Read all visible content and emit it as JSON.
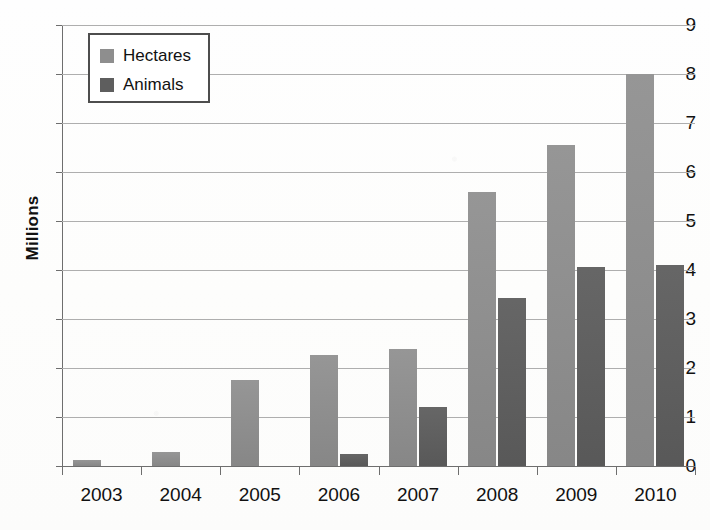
{
  "chart_data": {
    "type": "bar",
    "title": "",
    "xlabel": "",
    "ylabel": "Millions",
    "categories": [
      "2003",
      "2004",
      "2005",
      "2006",
      "2007",
      "2008",
      "2009",
      "2010"
    ],
    "series": [
      {
        "name": "Hectares",
        "color": "#8e8e8e",
        "values": [
          0.12,
          0.28,
          1.76,
          2.26,
          2.38,
          5.59,
          6.55,
          8.0
        ]
      },
      {
        "name": "Animals",
        "color": "#5e5e5e",
        "values": [
          0,
          0,
          0,
          0.25,
          1.2,
          3.43,
          4.06,
          4.1
        ]
      }
    ],
    "ylim": [
      0,
      9
    ],
    "ytick_labels": [
      "0",
      "1",
      "2",
      "3",
      "4",
      "5",
      "6",
      "7",
      "8",
      "9"
    ],
    "ytick_values": [
      0,
      1,
      2,
      3,
      4,
      5,
      6,
      7,
      8,
      9
    ],
    "grid": true,
    "grid_axis": "y",
    "legend_position": "top-left",
    "legend_entries": [
      "Hectares",
      "Animals"
    ]
  }
}
